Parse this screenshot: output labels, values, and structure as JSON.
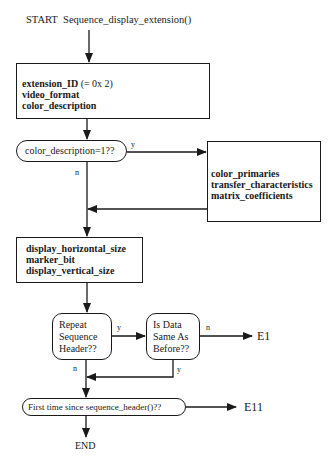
{
  "diagram": {
    "start": {
      "label": "START",
      "function": "Sequence_display_extension()"
    },
    "box1": {
      "lines": [
        {
          "bold": "extension_ID",
          "rest": " (= 0x 2)"
        },
        {
          "bold": "video_format",
          "rest": ""
        },
        {
          "bold": "color_description",
          "rest": ""
        }
      ]
    },
    "decision1": {
      "label": "color_description=1??",
      "yes": "y",
      "no": "n"
    },
    "box_color": {
      "lines": [
        "color_primaries",
        "transfer_characteristics",
        "matrix_coefficients"
      ]
    },
    "box2": {
      "lines": [
        "display_horizontal_size",
        "marker_bit",
        "display_vertical_size"
      ]
    },
    "decision2": {
      "lines": [
        "Repeat",
        "Sequence",
        "Header??"
      ],
      "yes": "y",
      "no": "n"
    },
    "decision3": {
      "lines": [
        "Is Data",
        "Same As",
        "Before??"
      ],
      "yes": "y",
      "no": "n"
    },
    "error1": "E1",
    "decision4": {
      "label": "First time since sequence_header()??"
    },
    "error2": "E11",
    "end": "END"
  }
}
